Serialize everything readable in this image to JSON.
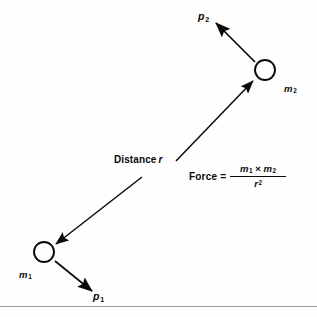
{
  "figure": {
    "background_color": "#fefefe",
    "ink_color": "#0a0a0a",
    "rule_color": "#9a9a9a"
  },
  "bodies": [
    {
      "id": "m1",
      "label": "m",
      "subscript": "1",
      "center_x": 44,
      "center_y": 252,
      "radius": 10
    },
    {
      "id": "m2",
      "label": "m",
      "subscript": "2",
      "center_x": 265,
      "center_y": 70,
      "radius": 10
    }
  ],
  "momentum_vectors": [
    {
      "id": "p1",
      "label": "p",
      "subscript": "1",
      "from_x": 55,
      "from_y": 261,
      "to_x": 92,
      "to_y": 291
    },
    {
      "id": "p2",
      "label": "p",
      "subscript": "2",
      "from_x": 255,
      "from_y": 62,
      "to_x": 216,
      "to_y": 23
    }
  ],
  "distance": {
    "label": "Distance",
    "variable": "r",
    "arrow_up_from_x": 176,
    "arrow_up_from_y": 161,
    "arrow_up_to_x": 253,
    "arrow_up_to_y": 81,
    "arrow_down_from_x": 142,
    "arrow_down_from_y": 177,
    "arrow_down_to_x": 56,
    "arrow_down_to_y": 244
  },
  "formula": {
    "lhs": "Force",
    "equals": "=",
    "numerator_first": "m",
    "numerator_first_sub": "1",
    "times": "×",
    "numerator_second": "m",
    "numerator_second_sub": "2",
    "denominator": "r",
    "denominator_exp": "2"
  },
  "bottom_rule": {
    "present": true,
    "y": 306
  }
}
